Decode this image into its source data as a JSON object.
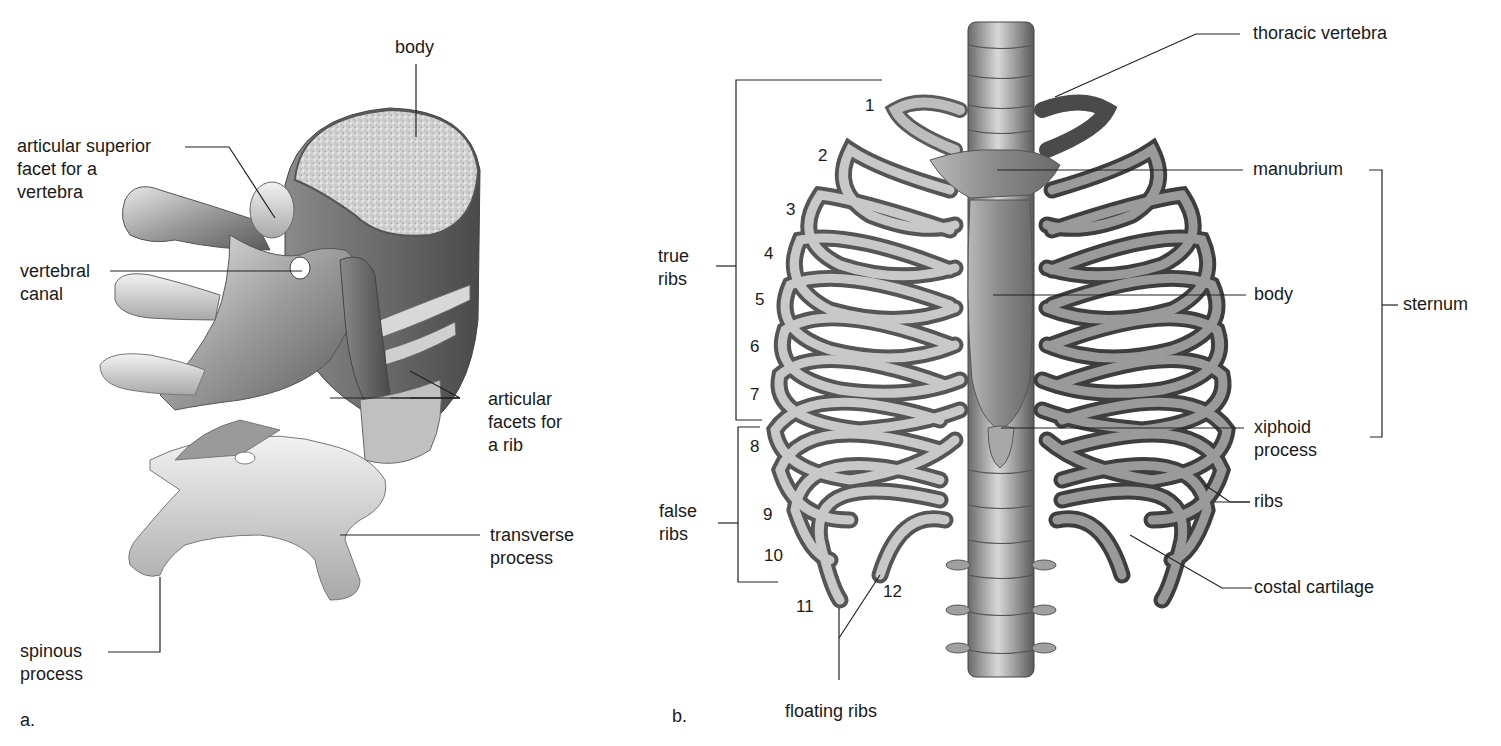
{
  "figure": {
    "panel_a": {
      "letter": "a.",
      "subject": "thoracic vertebra (superior-lateral view)",
      "labels": {
        "body": "body",
        "articular_superior_facet": "articular superior\nfacet for a\nvertebra",
        "vertebral_canal": "vertebral\ncanal",
        "articular_facets_rib": "articular\nfacets for\na rib",
        "transverse_process": "transverse\nprocess",
        "spinous_process": "spinous\nprocess"
      }
    },
    "panel_b": {
      "letter": "b.",
      "subject": "thoracic cage (anterior view)",
      "labels": {
        "thoracic_vertebra": "thoracic vertebra",
        "manubrium": "manubrium",
        "body": "body",
        "sternum": "sternum",
        "xiphoid_process": "xiphoid\nprocess",
        "ribs": "ribs",
        "costal_cartilage": "costal cartilage",
        "true_ribs": "true\nribs",
        "false_ribs": "false\nribs",
        "floating_ribs": "floating ribs"
      },
      "rib_numbers": [
        "1",
        "2",
        "3",
        "4",
        "5",
        "6",
        "7",
        "8",
        "9",
        "10",
        "11",
        "12"
      ]
    }
  }
}
